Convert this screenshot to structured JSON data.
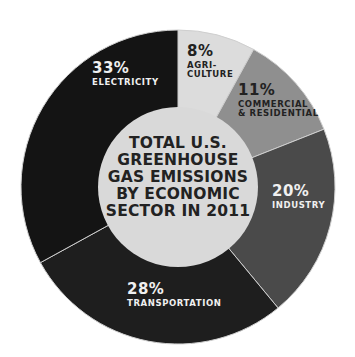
{
  "chart_data": {
    "type": "pie",
    "variant": "donut",
    "title": "TOTAL U.S. GREENHOUSE GAS EMISSIONS BY ECONOMIC SECTOR IN 2011",
    "title_lines": "TOTAL U.S.\nGREENHOUSE\nGAS EMISSIONS\nBY ECONOMIC\nSECTOR IN 2011",
    "categories": [
      "Agriculture",
      "Commercial & Residential",
      "Industry",
      "Transportation",
      "Electricity"
    ],
    "values": [
      8,
      11,
      20,
      28,
      33
    ],
    "unit": "%",
    "start_angle_deg": 0,
    "direction": "clockwise",
    "colors": [
      "#dcdcdc",
      "#8f8f8f",
      "#4a4a4a",
      "#1e1e1e",
      "#141414"
    ],
    "center_color": "#d9d9d9",
    "separator_color": "#cfcfcf",
    "legend": "none (inline labels)"
  },
  "labels": [
    {
      "pct": "8%",
      "name": "AGRI-\nCULTURE",
      "tone": "dark",
      "x": 187,
      "y": 44
    },
    {
      "pct": "11%",
      "name": "COMMERCIAL\n& RESIDENTIAL",
      "tone": "dark",
      "x": 238,
      "y": 83
    },
    {
      "pct": "20%",
      "name": "INDUSTRY",
      "tone": "light",
      "x": 272,
      "y": 184
    },
    {
      "pct": "28%",
      "name": "TRANSPORTATION",
      "tone": "light",
      "x": 127,
      "y": 282
    },
    {
      "pct": "33%",
      "name": "ELECTRICITY",
      "tone": "light",
      "x": 92,
      "y": 61
    }
  ]
}
